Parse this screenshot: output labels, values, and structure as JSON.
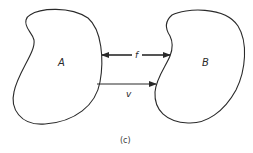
{
  "diagram": {
    "caption": "(c)",
    "nodes": [
      {
        "id": "A",
        "label": "A"
      },
      {
        "id": "B",
        "label": "B"
      }
    ],
    "edges": [
      {
        "id": "f",
        "label": "f",
        "from": "A",
        "to": "B",
        "direction": "bidirectional"
      },
      {
        "id": "v",
        "label": "v",
        "from": "A",
        "to": "B",
        "direction": "forward"
      }
    ],
    "colors": {
      "stroke": "#2a2a2a",
      "background": "#ffffff"
    }
  }
}
